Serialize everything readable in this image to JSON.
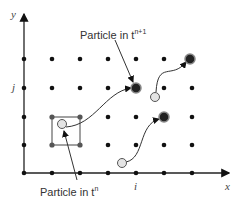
{
  "axes": {
    "x_label": "x",
    "y_label": "y",
    "x_tick_label": "i",
    "y_tick_label": "j"
  },
  "labels": {
    "particle_next": "Particle in t",
    "particle_next_sup": "n+1",
    "particle_current": "Particle in t",
    "particle_current_sup": "n"
  },
  "colors": {
    "grid_node": "#111111",
    "particle_next_fill": "#222222",
    "particle_current_fill": "#e4e4e4",
    "line": "#333333"
  }
}
